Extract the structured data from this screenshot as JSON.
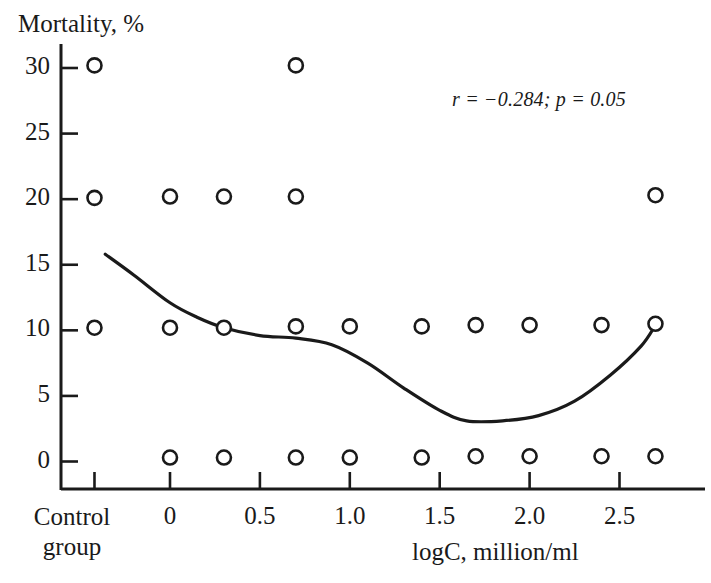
{
  "figure": {
    "background": "#ffffff",
    "ink_color": "#1a1a1a"
  },
  "annotation": {
    "stats_text": "r = −0.284; p = 0.05"
  },
  "axes": {
    "y_title": "Mortality, %",
    "x_title": "logC, million/ml",
    "control_label_line1": "Control",
    "control_label_line2": "group",
    "y_tick_labels": [
      "0",
      "5",
      "10",
      "15",
      "20",
      "25",
      "30"
    ],
    "x_tick_labels": [
      "0",
      "0.5",
      "1.0",
      "1.5",
      "2.0",
      "2.5"
    ]
  },
  "chart_data": {
    "type": "scatter",
    "title": "",
    "xlabel": "logC, million/ml",
    "ylabel": "Mortality, %",
    "xlim": [
      -0.42,
      2.86
    ],
    "ylim": [
      0,
      32.5
    ],
    "grid": false,
    "legend": null,
    "annotations": [
      {
        "text": "r = −0.284; p = 0.05",
        "x": 2.0,
        "y": 27.5,
        "style": "italic"
      }
    ],
    "x_ticks": [
      0,
      0.5,
      1.0,
      1.5,
      2.0,
      2.5
    ],
    "x_category_tick": {
      "label": "Control group",
      "x": -0.42
    },
    "y_ticks": [
      0,
      5,
      10,
      15,
      20,
      25,
      30
    ],
    "marker": {
      "shape": "open-circle",
      "fill": "#ffffff",
      "stroke": "#1a1a1a",
      "radius_px": 7
    },
    "series": [
      {
        "name": "Mortality observations",
        "points": [
          {
            "x": -0.42,
            "y": 10.2,
            "group": "control"
          },
          {
            "x": -0.42,
            "y": 20.1,
            "group": "control"
          },
          {
            "x": -0.42,
            "y": 30.2,
            "group": "control"
          },
          {
            "x": 0.0,
            "y": 0.3
          },
          {
            "x": 0.0,
            "y": 10.2
          },
          {
            "x": 0.0,
            "y": 20.2
          },
          {
            "x": 0.3,
            "y": 0.3
          },
          {
            "x": 0.3,
            "y": 10.2
          },
          {
            "x": 0.3,
            "y": 20.2
          },
          {
            "x": 0.7,
            "y": 0.3
          },
          {
            "x": 0.7,
            "y": 10.3
          },
          {
            "x": 0.7,
            "y": 20.2
          },
          {
            "x": 0.7,
            "y": 30.2
          },
          {
            "x": 1.0,
            "y": 0.3
          },
          {
            "x": 1.0,
            "y": 10.3
          },
          {
            "x": 1.4,
            "y": 0.3
          },
          {
            "x": 1.4,
            "y": 10.3
          },
          {
            "x": 1.7,
            "y": 0.4
          },
          {
            "x": 1.7,
            "y": 10.4
          },
          {
            "x": 2.0,
            "y": 0.4
          },
          {
            "x": 2.0,
            "y": 10.4
          },
          {
            "x": 2.4,
            "y": 0.4
          },
          {
            "x": 2.4,
            "y": 10.4
          },
          {
            "x": 2.7,
            "y": 0.4
          },
          {
            "x": 2.7,
            "y": 10.5
          },
          {
            "x": 2.7,
            "y": 20.3
          }
        ]
      },
      {
        "name": "Trend curve",
        "type": "line",
        "smoothed": true,
        "stroke": "#1a1a1a",
        "points": [
          {
            "x": -0.36,
            "y": 15.8
          },
          {
            "x": -0.2,
            "y": 14.2
          },
          {
            "x": 0.0,
            "y": 12.1
          },
          {
            "x": 0.15,
            "y": 11.0
          },
          {
            "x": 0.3,
            "y": 10.2
          },
          {
            "x": 0.5,
            "y": 9.6
          },
          {
            "x": 0.7,
            "y": 9.4
          },
          {
            "x": 0.9,
            "y": 8.9
          },
          {
            "x": 1.1,
            "y": 7.5
          },
          {
            "x": 1.3,
            "y": 5.6
          },
          {
            "x": 1.5,
            "y": 3.9
          },
          {
            "x": 1.65,
            "y": 3.1
          },
          {
            "x": 1.85,
            "y": 3.1
          },
          {
            "x": 2.05,
            "y": 3.5
          },
          {
            "x": 2.25,
            "y": 4.6
          },
          {
            "x": 2.45,
            "y": 6.6
          },
          {
            "x": 2.62,
            "y": 8.8
          },
          {
            "x": 2.7,
            "y": 10.4
          }
        ]
      }
    ]
  }
}
